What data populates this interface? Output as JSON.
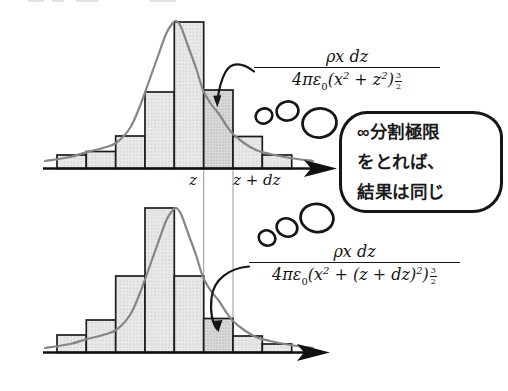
{
  "figure": {
    "width": 508,
    "height": 391,
    "colors": {
      "bar_fill": "#e8e8e8",
      "bar_dot": "#bdbdbd",
      "bar_fill_highlight": "#d9d9d9",
      "bar_dot_highlight": "#9e9e9e",
      "bar_border": "#1c1c1c",
      "curve": "#868686",
      "axis": "#111111",
      "ref_line": "#969696",
      "ink": "#161616"
    }
  },
  "histograms": {
    "bar_edges": [
      57,
      86.3,
      115.7,
      145,
      174.3,
      203.7,
      233,
      262.3,
      291.7
    ],
    "highlight_bar_index": 5,
    "top": {
      "axis_y": 168.5,
      "axis_x0": 43,
      "axis_x1": 337,
      "bar_tops": [
        155,
        151.5,
        136,
        92,
        22,
        90,
        136.5,
        155
      ],
      "curve": [
        [
          45,
          161
        ],
        [
          70,
          157
        ],
        [
          87,
          152
        ],
        [
          103,
          148
        ],
        [
          116,
          143
        ],
        [
          130,
          128
        ],
        [
          140,
          106
        ],
        [
          148,
          84
        ],
        [
          158,
          56
        ],
        [
          166,
          34
        ],
        [
          172,
          24
        ],
        [
          176,
          21
        ],
        [
          181,
          27
        ],
        [
          188,
          46
        ],
        [
          196,
          68
        ],
        [
          203,
          90
        ],
        [
          211,
          104
        ],
        [
          219,
          114
        ],
        [
          226,
          125
        ],
        [
          233,
          134
        ],
        [
          244,
          143
        ],
        [
          256,
          150
        ],
        [
          270,
          154
        ],
        [
          290,
          158
        ],
        [
          313,
          161
        ]
      ]
    },
    "bottom": {
      "axis_y": 352.5,
      "axis_x0": 43,
      "axis_x1": 330,
      "bar_tops": [
        335,
        320,
        276,
        208,
        276,
        318.5,
        336,
        344
      ],
      "curve": [
        [
          45,
          348
        ],
        [
          70,
          344
        ],
        [
          87,
          339
        ],
        [
          103,
          335
        ],
        [
          116,
          330
        ],
        [
          130,
          315
        ],
        [
          140,
          293
        ],
        [
          148,
          271
        ],
        [
          158,
          243
        ],
        [
          166,
          221
        ],
        [
          172,
          211
        ],
        [
          176,
          208
        ],
        [
          181,
          214
        ],
        [
          188,
          233
        ],
        [
          196,
          255
        ],
        [
          203,
          277
        ],
        [
          211,
          291
        ],
        [
          219,
          301
        ],
        [
          226,
          312
        ],
        [
          233,
          321
        ],
        [
          244,
          330
        ],
        [
          256,
          337
        ],
        [
          270,
          341
        ],
        [
          290,
          345
        ],
        [
          313,
          348
        ]
      ]
    },
    "ref_lines": {
      "x_values": [
        203.7,
        233
      ],
      "y1": 170.5,
      "y2": 351
    }
  },
  "labels": {
    "z": "z",
    "z_dz": "z + dz"
  },
  "formula_top": {
    "num": "ρx dz",
    "d1": "4πε",
    "d1sub": "0",
    "d2": "(x",
    "sup_a": "2",
    "d3": " + z",
    "sup_b": "2",
    "d4": ")",
    "exp_n": "3",
    "exp_d": "2"
  },
  "formula_bottom": {
    "num": "ρx dz",
    "d1": "4πε",
    "d1sub": "0",
    "d2": "(x",
    "sup_a": "2",
    "d3": " + (z + dz)",
    "sup_b": "2",
    "d4": ")",
    "exp_n": "3",
    "exp_d": "2"
  },
  "bubble": {
    "lines": [
      "∞分割極限",
      "をとれば、",
      "結果は同じ"
    ]
  }
}
